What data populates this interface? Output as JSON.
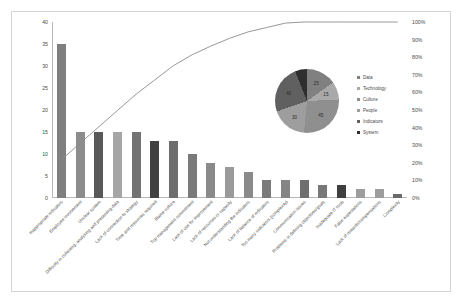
{
  "chart_data": {
    "type": "bar",
    "title": "",
    "subtitle": "",
    "xlabel": "",
    "ylabel": "",
    "ylim": [
      0,
      40
    ],
    "grid": false,
    "categories": [
      "Inappropriate indicators",
      "Employee involvement",
      "Unclear system",
      "Difficulty in collecting, analysing and presenting data",
      "Lack of connection to strategy",
      "Time and resources required",
      "Blame culture",
      "Top management commitment",
      "Lack of use for improvement",
      "Lack of resources or capacity",
      "Not understanding the indicators",
      "Lack of balance of indicators",
      "Too many indicators (complexity)",
      "Communication issues",
      "Problems in defining objectives/goals",
      "Inadequate IT tools",
      "False expectations",
      "Lack of rewards/compensations",
      "Complexity"
    ],
    "values": [
      35,
      15,
      15,
      15,
      15,
      13,
      13,
      10,
      8,
      7,
      6,
      4,
      4,
      4,
      3,
      3,
      2,
      2,
      1
    ],
    "bar_colors": [
      "#7f7f7f",
      "#8c8c8c",
      "#595959",
      "#a6a6a6",
      "#737373",
      "#404040",
      "#6e6e6e",
      "#7a7a7a",
      "#8a8a8a",
      "#9a9a9a",
      "#8a8a8a",
      "#7a7a7a",
      "#858585",
      "#6f6f6f",
      "#787878",
      "#3f3f3f",
      "#9d9d9d",
      "#9d9d9d",
      "#6a6a6a"
    ],
    "y_ticks": [
      0,
      5,
      10,
      15,
      20,
      25,
      30,
      35,
      40
    ],
    "secondary_axis": {
      "label": "",
      "ticks": [
        "0%",
        "10%",
        "20%",
        "30%",
        "40%",
        "50%",
        "60%",
        "70%",
        "80%",
        "90%",
        "100%"
      ],
      "tick_values": [
        0,
        10,
        20,
        30,
        40,
        50,
        60,
        70,
        80,
        90,
        100
      ],
      "series_name": "Cumulative %",
      "values": [
        21.7,
        31.1,
        40.4,
        49.7,
        59.0,
        67.1,
        75.2,
        81.4,
        86.3,
        90.7,
        94.4,
        96.9,
        99.4,
        101.9,
        103.7,
        105.6,
        106.8,
        108.1,
        108.7
      ],
      "line_color": "#8c8c8c"
    },
    "pie": {
      "type": "pie",
      "labels": [
        "Data",
        "Technology",
        "Culture",
        "People",
        "Indicators",
        "System"
      ],
      "values": [
        25,
        15,
        45,
        30,
        40,
        10
      ],
      "slice_labels": [
        "25",
        "15",
        "45",
        "30",
        "40",
        ""
      ],
      "colors": [
        "#808080",
        "#a9a9a9",
        "#8f8f8f",
        "#9e9e9e",
        "#606060",
        "#2f2f2f"
      ],
      "legend_position": "right"
    }
  },
  "legend": {
    "items": [
      {
        "label": "Data",
        "color": "#808080"
      },
      {
        "label": "Technology",
        "color": "#a9a9a9"
      },
      {
        "label": "Culture",
        "color": "#8f8f8f"
      },
      {
        "label": "People",
        "color": "#9e9e9e"
      },
      {
        "label": "Indicators",
        "color": "#606060"
      },
      {
        "label": "System",
        "color": "#2f2f2f"
      }
    ]
  }
}
